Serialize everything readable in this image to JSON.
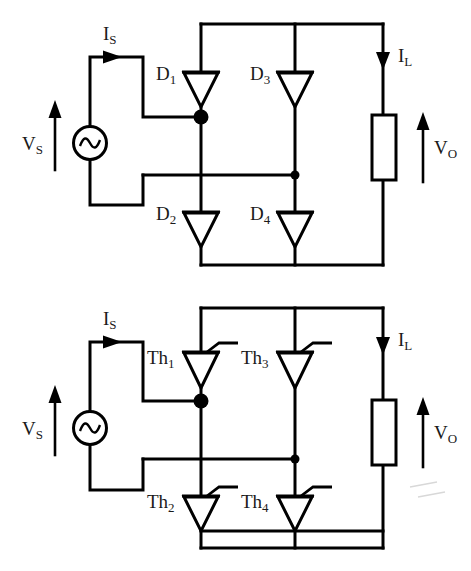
{
  "diagram": {
    "background_color": "#ffffff",
    "line_color": "#000000",
    "text_color": "#1a1a1a"
  },
  "circuits": [
    {
      "id": "diode-bridge",
      "name": "uncontrolled-diode-bridge",
      "source": {
        "name": "ac-voltage-source",
        "symbol": "sine-wave",
        "voltage_label": "V",
        "voltage_subscript": "S"
      },
      "source_current": {
        "label": "I",
        "subscript": "S",
        "direction": "right"
      },
      "load_current": {
        "label": "I",
        "subscript": "L",
        "direction": "down"
      },
      "output_voltage": {
        "label": "V",
        "subscript": "O",
        "direction": "up"
      },
      "load": {
        "name": "load-resistor",
        "symbol": "rectangle"
      },
      "switches": [
        {
          "name": "diode-d1",
          "label": "D",
          "subscript": "1",
          "type": "diode",
          "position": "top-left"
        },
        {
          "name": "diode-d3",
          "label": "D",
          "subscript": "3",
          "type": "diode",
          "position": "top-right"
        },
        {
          "name": "diode-d2",
          "label": "D",
          "subscript": "2",
          "type": "diode",
          "position": "bottom-left"
        },
        {
          "name": "diode-d4",
          "label": "D",
          "subscript": "4",
          "type": "diode",
          "position": "bottom-right"
        }
      ]
    },
    {
      "id": "thyristor-bridge",
      "name": "controlled-thyristor-bridge",
      "source": {
        "name": "ac-voltage-source",
        "symbol": "sine-wave",
        "voltage_label": "V",
        "voltage_subscript": "S"
      },
      "source_current": {
        "label": "I",
        "subscript": "S",
        "direction": "right"
      },
      "load_current": {
        "label": "I",
        "subscript": "L",
        "direction": "down"
      },
      "output_voltage": {
        "label": "V",
        "subscript": "O",
        "direction": "up"
      },
      "load": {
        "name": "load-resistor",
        "symbol": "rectangle"
      },
      "switches": [
        {
          "name": "thyristor-th1",
          "label": "Th",
          "subscript": "1",
          "type": "thyristor",
          "position": "top-left"
        },
        {
          "name": "thyristor-th3",
          "label": "Th",
          "subscript": "3",
          "type": "thyristor",
          "position": "top-right"
        },
        {
          "name": "thyristor-th2",
          "label": "Th",
          "subscript": "2",
          "type": "thyristor",
          "position": "bottom-left"
        },
        {
          "name": "thyristor-th4",
          "label": "Th",
          "subscript": "4",
          "type": "thyristor",
          "position": "bottom-right"
        }
      ]
    }
  ]
}
